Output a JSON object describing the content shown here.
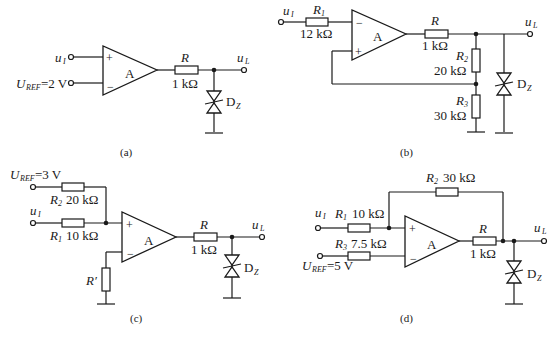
{
  "figure": {
    "panels": [
      {
        "id": "a",
        "caption": "(a)",
        "opamp_label": "A",
        "input_plus": "u",
        "input_plus_sub": "I",
        "input_minus": "U",
        "input_minus_sub": "REF",
        "input_minus_value": "=2 V",
        "plus_sign": "+",
        "minus_sign": "−",
        "r_label": "R",
        "r_value": "1 kΩ",
        "output": "u",
        "output_sub": "L",
        "zener": "D",
        "zener_sub": "Z"
      },
      {
        "id": "b",
        "caption": "(b)",
        "opamp_label": "A",
        "input": "u",
        "input_sub": "I",
        "r1_label": "R",
        "r1_sub": "1",
        "r1_value": "12 kΩ",
        "r_label": "R",
        "r_value": "1 kΩ",
        "r2_label": "R",
        "r2_sub": "2",
        "r2_value": "20 kΩ",
        "r3_label": "R",
        "r3_sub": "3",
        "r3_value": "30 kΩ",
        "plus_sign": "+",
        "minus_sign": "−",
        "output": "u",
        "output_sub": "L",
        "zener": "D",
        "zener_sub": "Z"
      },
      {
        "id": "c",
        "caption": "(c)",
        "opamp_label": "A",
        "ref": "U",
        "ref_sub": "REF",
        "ref_value": "=3 V",
        "input": "u",
        "input_sub": "I",
        "r2_label": "R",
        "r2_sub": "2",
        "r2_value": "20 kΩ",
        "r1_label": "R",
        "r1_sub": "1",
        "r1_value": "10 kΩ",
        "rprime_label": "R′",
        "r_label": "R",
        "r_value": "1 kΩ",
        "plus_sign": "+",
        "minus_sign": "−",
        "output": "u",
        "output_sub": "L",
        "zener": "D",
        "zener_sub": "Z"
      },
      {
        "id": "d",
        "caption": "(d)",
        "opamp_label": "A",
        "input": "u",
        "input_sub": "I",
        "r1_label": "R",
        "r1_sub": "1",
        "r1_value": "10 kΩ",
        "r2_label": "R",
        "r2_sub": "2",
        "r2_value": "30 kΩ",
        "r3_label": "R",
        "r3_sub": "3",
        "r3_value": "7.5 kΩ",
        "ref": "U",
        "ref_sub": "REF",
        "ref_value": "=5 V",
        "r_label": "R",
        "r_value": "1 kΩ",
        "plus_sign": "+",
        "minus_sign": "−",
        "output": "u",
        "output_sub": "L",
        "zener": "D",
        "zener_sub": "Z"
      }
    ]
  }
}
